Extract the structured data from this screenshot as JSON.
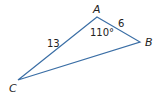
{
  "diagram": {
    "type": "triangle",
    "line_color": "#3a6ea5",
    "vertices": [
      {
        "name": "A",
        "label": "A"
      },
      {
        "name": "B",
        "label": "B"
      },
      {
        "name": "C",
        "label": "C"
      }
    ],
    "sides": {
      "AC": "13",
      "AB": "6"
    },
    "angles": {
      "A": "110°"
    }
  }
}
